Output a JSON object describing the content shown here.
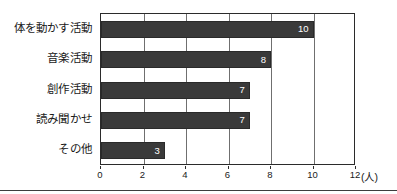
{
  "chart_data": {
    "type": "bar",
    "orientation": "horizontal",
    "title": "",
    "xlabel": "(人)",
    "ylabel": "",
    "categories": [
      "体を動かす活動",
      "音楽活動",
      "創作活動",
      "読み聞かせ",
      "その他"
    ],
    "values": [
      10,
      8,
      7,
      7,
      3
    ],
    "value_labels": [
      "10",
      "8",
      "7",
      "7",
      "3"
    ],
    "xlim": [
      0,
      12
    ],
    "xticks": [
      0,
      2,
      4,
      6,
      8,
      10,
      12
    ],
    "xtick_labels": [
      "0",
      "2",
      "4",
      "6",
      "8",
      "10",
      "12"
    ],
    "grid": true,
    "grid_axis": "x",
    "legend": false,
    "unit": "(人)",
    "bar_color": "#3a3a3a",
    "value_label_color": "#ffffff",
    "axis_color": "#2b2b2b",
    "gridline_color": "#6f6f6f",
    "background_color": "#ffffff"
  }
}
